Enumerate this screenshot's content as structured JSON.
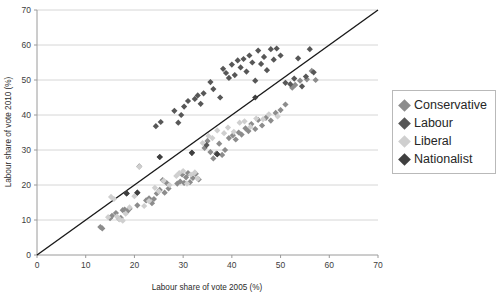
{
  "chart_data": {
    "type": "scatter",
    "title": "",
    "xlabel": "Labour share of vote 2005 (%)",
    "ylabel": "Labour share of vote 2010 (%)",
    "xlim": [
      0,
      70
    ],
    "ylim": [
      0,
      70
    ],
    "xticks": [
      0,
      10,
      20,
      30,
      40,
      50,
      60,
      70
    ],
    "yticks": [
      0,
      10,
      20,
      30,
      40,
      50,
      60,
      70
    ],
    "grid": "horizontal",
    "legend_position": "right",
    "reference_line": {
      "name": "y = x",
      "from": [
        0,
        0
      ],
      "to": [
        70,
        70
      ],
      "color": "#1a1a1a"
    },
    "series": [
      {
        "name": "Conservative",
        "color": "#8c8c8c",
        "marker": "diamond",
        "points": [
          [
            13.0,
            8.0
          ],
          [
            13.4,
            7.6
          ],
          [
            15.0,
            10.5
          ],
          [
            15.4,
            11.2
          ],
          [
            16.2,
            12.0
          ],
          [
            16.8,
            10.4
          ],
          [
            17.2,
            10.6
          ],
          [
            17.6,
            12.8
          ],
          [
            18.0,
            13.0
          ],
          [
            18.5,
            12.4
          ],
          [
            19.0,
            13.2
          ],
          [
            20.6,
            14.2
          ],
          [
            21.0,
            25.3
          ],
          [
            22.4,
            15.6
          ],
          [
            23.0,
            16.2
          ],
          [
            23.6,
            14.8
          ],
          [
            24.0,
            16.0
          ],
          [
            24.6,
            17.6
          ],
          [
            25.2,
            18.6
          ],
          [
            25.8,
            21.4
          ],
          [
            26.2,
            17.8
          ],
          [
            26.6,
            20.6
          ],
          [
            27.0,
            19.0
          ],
          [
            28.8,
            20.4
          ],
          [
            29.4,
            21.0
          ],
          [
            29.8,
            23.0
          ],
          [
            30.2,
            20.6
          ],
          [
            30.6,
            22.2
          ],
          [
            31.0,
            23.4
          ],
          [
            31.4,
            20.8
          ],
          [
            32.0,
            22.0
          ],
          [
            32.6,
            23.2
          ],
          [
            33.2,
            21.6
          ],
          [
            34.4,
            30.6
          ],
          [
            35.0,
            32.6
          ],
          [
            35.6,
            29.4
          ],
          [
            36.2,
            27.6
          ],
          [
            36.8,
            29.0
          ],
          [
            37.4,
            31.8
          ],
          [
            38.0,
            28.6
          ],
          [
            38.6,
            30.0
          ],
          [
            39.4,
            33.4
          ],
          [
            40.2,
            34.2
          ],
          [
            40.8,
            33.0
          ],
          [
            41.4,
            35.0
          ],
          [
            42.0,
            34.4
          ],
          [
            42.8,
            36.2
          ],
          [
            43.4,
            35.4
          ],
          [
            44.0,
            37.4
          ],
          [
            44.8,
            36.0
          ],
          [
            45.4,
            38.6
          ],
          [
            46.2,
            37.0
          ],
          [
            47.0,
            39.2
          ],
          [
            48.0,
            38.4
          ],
          [
            49.0,
            40.6
          ],
          [
            50.0,
            41.4
          ],
          [
            51.0,
            43.0
          ],
          [
            52.4,
            47.8
          ],
          [
            53.0,
            48.6
          ],
          [
            54.0,
            49.8
          ],
          [
            55.4,
            50.2
          ],
          [
            56.4,
            52.6
          ],
          [
            57.2,
            50.0
          ]
        ]
      },
      {
        "name": "Labour",
        "color": "#575757",
        "marker": "diamond",
        "points": [
          [
            18.4,
            17.6
          ],
          [
            20.6,
            17.8
          ],
          [
            24.4,
            36.8
          ],
          [
            25.2,
            28.0
          ],
          [
            25.4,
            38.0
          ],
          [
            28.2,
            41.2
          ],
          [
            29.0,
            37.8
          ],
          [
            29.6,
            40.0
          ],
          [
            30.2,
            42.4
          ],
          [
            31.0,
            44.0
          ],
          [
            31.8,
            29.2
          ],
          [
            32.4,
            44.6
          ],
          [
            33.0,
            45.6
          ],
          [
            33.6,
            43.2
          ],
          [
            34.2,
            46.2
          ],
          [
            34.8,
            31.4
          ],
          [
            35.6,
            49.4
          ],
          [
            36.2,
            47.4
          ],
          [
            37.0,
            28.8
          ],
          [
            37.6,
            45.0
          ],
          [
            38.2,
            53.2
          ],
          [
            38.8,
            52.0
          ],
          [
            39.4,
            50.6
          ],
          [
            40.0,
            54.4
          ],
          [
            40.6,
            51.4
          ],
          [
            41.2,
            55.6
          ],
          [
            41.8,
            53.6
          ],
          [
            42.4,
            56.0
          ],
          [
            43.0,
            52.4
          ],
          [
            43.6,
            57.0
          ],
          [
            44.2,
            55.0
          ],
          [
            44.8,
            49.8
          ],
          [
            45.4,
            58.4
          ],
          [
            46.0,
            54.6
          ],
          [
            46.6,
            56.6
          ],
          [
            47.2,
            52.8
          ],
          [
            48.0,
            58.8
          ],
          [
            48.6,
            55.8
          ],
          [
            49.2,
            59.0
          ],
          [
            50.0,
            57.0
          ],
          [
            51.0,
            49.2
          ],
          [
            52.0,
            48.8
          ],
          [
            52.8,
            50.4
          ],
          [
            53.6,
            56.2
          ],
          [
            54.4,
            48.2
          ],
          [
            55.2,
            51.0
          ],
          [
            56.0,
            58.8
          ],
          [
            56.8,
            52.2
          ]
        ]
      },
      {
        "name": "Liberal",
        "color": "#cfcfcf",
        "marker": "diamond",
        "points": [
          [
            14.6,
            10.8
          ],
          [
            15.2,
            16.6
          ],
          [
            15.8,
            16.0
          ],
          [
            16.4,
            11.0
          ],
          [
            17.0,
            10.2
          ],
          [
            17.6,
            9.8
          ],
          [
            18.2,
            11.8
          ],
          [
            19.0,
            13.6
          ],
          [
            20.0,
            16.8
          ],
          [
            21.0,
            25.2
          ],
          [
            22.0,
            14.0
          ],
          [
            23.0,
            15.4
          ],
          [
            24.2,
            19.2
          ],
          [
            25.0,
            18.2
          ],
          [
            26.0,
            21.2
          ],
          [
            27.2,
            20.0
          ],
          [
            28.6,
            22.6
          ],
          [
            29.2,
            23.4
          ],
          [
            30.0,
            24.0
          ],
          [
            30.8,
            20.4
          ],
          [
            31.6,
            23.0
          ],
          [
            32.4,
            23.6
          ],
          [
            33.0,
            21.8
          ],
          [
            34.0,
            32.0
          ],
          [
            35.2,
            34.0
          ],
          [
            36.0,
            33.4
          ],
          [
            37.0,
            35.6
          ],
          [
            38.4,
            34.8
          ],
          [
            39.2,
            36.4
          ],
          [
            40.4,
            35.2
          ],
          [
            41.6,
            37.8
          ],
          [
            42.6,
            38.2
          ],
          [
            43.8,
            36.6
          ],
          [
            45.0,
            39.0
          ],
          [
            46.4,
            38.8
          ],
          [
            47.6,
            40.2
          ],
          [
            49.4,
            39.6
          ]
        ]
      },
      {
        "name": "Nationalist",
        "color": "#3f3f3f",
        "marker": "diamond",
        "points": [
          [
            18.4,
            17.6
          ],
          [
            20.6,
            17.8
          ],
          [
            25.2,
            28.0
          ],
          [
            31.8,
            29.2
          ],
          [
            37.0,
            28.8
          ],
          [
            44.8,
            45.0
          ]
        ]
      }
    ]
  },
  "legend": {
    "items": [
      {
        "label": "Conservative",
        "color": "#8c8c8c"
      },
      {
        "label": "Labour",
        "color": "#575757"
      },
      {
        "label": "Liberal",
        "color": "#cfcfcf"
      },
      {
        "label": "Nationalist",
        "color": "#3f3f3f"
      }
    ]
  },
  "axes": {
    "x_title": "Labour share of vote 2005 (%)",
    "y_title": "Labour share of vote 2010 (%)",
    "x_tick_labels": [
      "0",
      "10",
      "20",
      "30",
      "40",
      "50",
      "60",
      "70"
    ],
    "y_tick_labels": [
      "0",
      "10",
      "20",
      "30",
      "40",
      "50",
      "60",
      "70"
    ]
  }
}
